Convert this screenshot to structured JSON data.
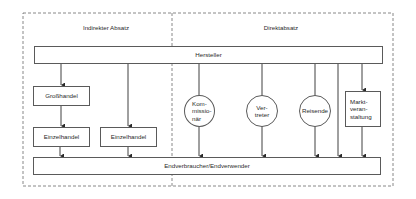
{
  "diagram": {
    "sections": {
      "indirect": "Indirekter Absatz",
      "direct": "Direktabsatz"
    },
    "producer": "Hersteller",
    "consumer": "Endverbraucher/Endverwender",
    "indirect_nodes": {
      "wholesale": "Großhandel",
      "retail_1": "Einzelhandel",
      "retail_2": "Einzelhandel"
    },
    "direct_nodes": {
      "commission_agent": "Kom-\nmissio-\nnär",
      "representative": "Ver-\ntreter",
      "traveling_sales": "Reisende",
      "market_event": "Markt-\nveran-\nstaltung"
    },
    "edges": [
      [
        "Hersteller",
        "Großhandel"
      ],
      [
        "Großhandel",
        "Einzelhandel"
      ],
      [
        "Hersteller",
        "Einzelhandel (2)"
      ],
      [
        "Einzelhandel",
        "Endverbraucher/Endverwender"
      ],
      [
        "Einzelhandel (2)",
        "Endverbraucher/Endverwender"
      ],
      [
        "Hersteller",
        "Kommissionär"
      ],
      [
        "Kommissionär",
        "Endverbraucher/Endverwender"
      ],
      [
        "Hersteller",
        "Vertreter"
      ],
      [
        "Vertreter",
        "Endverbraucher/Endverwender"
      ],
      [
        "Hersteller",
        "Reisende"
      ],
      [
        "Reisende",
        "Endverbraucher/Endverwender"
      ],
      [
        "Hersteller",
        "Endverbraucher/Endverwender"
      ],
      [
        "Hersteller",
        "Marktveranstaltung"
      ],
      [
        "Marktveranstaltung",
        "Endverbraucher/Endverwender"
      ]
    ]
  }
}
